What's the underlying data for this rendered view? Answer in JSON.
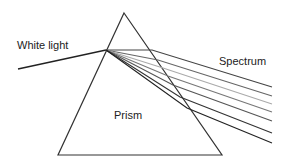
{
  "labels": {
    "white_light": "White light",
    "spectrum": "Spectrum",
    "prism": "Prism"
  },
  "prism": {
    "apex": [
      124,
      13
    ],
    "bottom_left": [
      58,
      155
    ],
    "bottom_right": [
      222,
      155
    ],
    "stroke": "#333333"
  },
  "incident_ray": {
    "from": [
      18,
      69
    ],
    "to": [
      106,
      50
    ],
    "stroke": "#222222"
  },
  "spectrum_rays": [
    {
      "exit": [
        152,
        50
      ],
      "end": [
        272,
        87
      ],
      "stroke": "#444444"
    },
    {
      "exit": [
        158,
        60
      ],
      "end": [
        272,
        96
      ],
      "stroke": "#666666"
    },
    {
      "exit": [
        163,
        68
      ],
      "end": [
        272,
        104
      ],
      "stroke": "#aaaaaa"
    },
    {
      "exit": [
        168,
        76
      ],
      "end": [
        272,
        112
      ],
      "stroke": "#777777"
    },
    {
      "exit": [
        173,
        85
      ],
      "end": [
        272,
        121
      ],
      "stroke": "#555555"
    },
    {
      "exit": [
        180,
        97
      ],
      "end": [
        272,
        133
      ],
      "stroke": "#333333"
    },
    {
      "exit": [
        187,
        108
      ],
      "end": [
        272,
        143
      ],
      "stroke": "#222222"
    }
  ]
}
